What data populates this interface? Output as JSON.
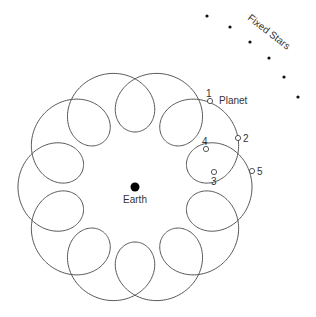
{
  "diagram": {
    "type": "epicycle-retrograde-motion",
    "colors": {
      "curve": "#555555",
      "earth": "#000000",
      "star": "#111111",
      "text": "#333333"
    },
    "earth": {
      "label": "Earth",
      "x": 135,
      "y": 187
    },
    "curve": {
      "deferent_radius": 86,
      "epicycle_radius": 31,
      "loops": 10
    },
    "planet": {
      "label": "Planet"
    },
    "positions": [
      {
        "label": "1",
        "x": 210,
        "y": 101,
        "lx": 206,
        "ly": 97
      },
      {
        "label": "2",
        "x": 238,
        "y": 138,
        "lx": 243,
        "ly": 142
      },
      {
        "label": "3",
        "x": 214,
        "y": 172,
        "lx": 211,
        "ly": 185
      },
      {
        "label": "4",
        "x": 206,
        "y": 149,
        "lx": 202,
        "ly": 145
      },
      {
        "label": "5",
        "x": 252,
        "y": 171,
        "lx": 257,
        "ly": 175
      }
    ],
    "fixed_stars": {
      "label": "Fixed Stars",
      "stars": [
        {
          "x": 207,
          "y": 16
        },
        {
          "x": 230,
          "y": 27
        },
        {
          "x": 250,
          "y": 42
        },
        {
          "x": 269,
          "y": 58
        },
        {
          "x": 284,
          "y": 77
        },
        {
          "x": 298,
          "y": 97
        }
      ]
    }
  }
}
